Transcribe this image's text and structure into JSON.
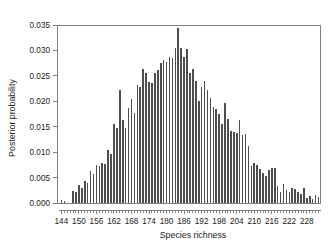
{
  "chart_data": {
    "type": "bar",
    "title": "",
    "subtitle": "",
    "xlabel": "Species richness",
    "ylabel": "Posterior probability",
    "xlim": [
      142.5,
      232.5
    ],
    "ylim": [
      0.0,
      0.035
    ],
    "grid": false,
    "legend": null,
    "xticks": [
      144,
      150,
      156,
      162,
      168,
      174,
      180,
      186,
      192,
      198,
      204,
      210,
      216,
      222,
      228
    ],
    "xtick_labels": [
      "144",
      "150",
      "156",
      "162",
      "168",
      "174",
      "180",
      "186",
      "192",
      "198",
      "204",
      "210",
      "216",
      "222",
      "228"
    ],
    "xtick_minor_step": 1,
    "yticks": [
      0.0,
      0.005,
      0.01,
      0.015,
      0.02,
      0.025,
      0.03,
      0.035
    ],
    "ytick_labels": [
      "0.000",
      "0.005",
      "0.010",
      "0.015",
      "0.020",
      "0.025",
      "0.030",
      "0.035"
    ],
    "bar_color": "#4d4d4d",
    "axis_color": "#808080",
    "categories": [
      144,
      145,
      146,
      147,
      148,
      149,
      150,
      151,
      152,
      153,
      154,
      155,
      156,
      157,
      158,
      159,
      160,
      161,
      162,
      163,
      164,
      165,
      166,
      167,
      168,
      169,
      170,
      171,
      172,
      173,
      174,
      175,
      176,
      177,
      178,
      179,
      180,
      181,
      182,
      183,
      184,
      185,
      186,
      187,
      188,
      189,
      190,
      191,
      192,
      193,
      194,
      195,
      196,
      197,
      198,
      199,
      200,
      201,
      202,
      203,
      204,
      205,
      206,
      207,
      208,
      209,
      210,
      211,
      212,
      213,
      214,
      215,
      216,
      217,
      218,
      219,
      220,
      221,
      222,
      223,
      224,
      225,
      226,
      227,
      228,
      229,
      230,
      231,
      232
    ],
    "values": [
      0.0005,
      0.0004,
      0.0,
      0.0,
      0.0023,
      0.0021,
      0.0035,
      0.0029,
      0.0044,
      0.0039,
      0.0062,
      0.0057,
      0.0075,
      0.0072,
      0.0079,
      0.0076,
      0.0105,
      0.0097,
      0.0155,
      0.0148,
      0.0222,
      0.0163,
      0.0148,
      0.0186,
      0.0204,
      0.0177,
      0.0232,
      0.0229,
      0.0263,
      0.0255,
      0.0237,
      0.0236,
      0.0255,
      0.0262,
      0.0275,
      0.0282,
      0.0278,
      0.0288,
      0.0285,
      0.0305,
      0.0345,
      0.0305,
      0.0288,
      0.0303,
      0.0255,
      0.0263,
      0.0239,
      0.0201,
      0.0229,
      0.0239,
      0.0223,
      0.0207,
      0.0188,
      0.0185,
      0.0175,
      0.0155,
      0.0197,
      0.0166,
      0.0141,
      0.0139,
      0.0137,
      0.0163,
      0.0133,
      0.0135,
      0.0113,
      0.0073,
      0.0078,
      0.0075,
      0.0066,
      0.0059,
      0.0053,
      0.0064,
      0.0068,
      0.0069,
      0.0033,
      0.0022,
      0.0037,
      0.0026,
      0.0022,
      0.0029,
      0.0027,
      0.0021,
      0.0018,
      0.0029,
      0.0009,
      0.0013,
      0.0007,
      0.0016,
      0.0012
    ]
  }
}
